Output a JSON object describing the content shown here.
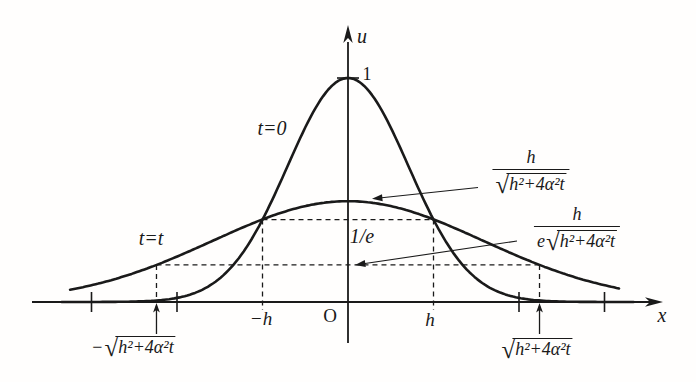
{
  "figure": {
    "ink_color": "#1a1a1a",
    "background_color": "#fffefd",
    "axis": {
      "vertical_label": "u",
      "horizontal_label": "x",
      "origin_label": "O"
    },
    "curve_labels": {
      "t_zero": "t=0",
      "t_t": "t=t"
    },
    "value_labels": {
      "one": "1",
      "one_over_e": "1/e",
      "minus_h": "−h",
      "plus_h": "h"
    },
    "formulas": {
      "radical_sign": "√",
      "flat_peak": {
        "num": "h",
        "pre": "",
        "radicand": "h²+4α²t"
      },
      "flat_over_e": {
        "num": "h",
        "pre": "e",
        "radicand": "h²+4α²t"
      },
      "left_root": {
        "sign": "−",
        "radicand": "h²+4α²t"
      },
      "right_root": {
        "sign": "",
        "radicand": "h²+4α²t"
      }
    }
  },
  "chart_data": {
    "type": "line",
    "title": "",
    "xlabel": "x",
    "ylabel": "u",
    "x_unit": "h",
    "grid": false,
    "series": [
      {
        "name": "t=0",
        "shape": "gaussian",
        "peak": 1.0,
        "sigma": 1.0,
        "drawn_x_range": [
          -3.35,
          3.35
        ]
      },
      {
        "name": "t=t",
        "shape": "gaussian",
        "peak": 0.45,
        "sigma": 2.24,
        "drawn_x_range": [
          -3.25,
          3.19
        ]
      }
    ],
    "x_marks": [
      {
        "x": -2.24,
        "label": "−√(h²+4α²t)"
      },
      {
        "x": -1,
        "label": "−h"
      },
      {
        "x": 0,
        "label": "O"
      },
      {
        "x": 1,
        "label": "h"
      },
      {
        "x": 2.24,
        "label": "√(h²+4α²t)"
      }
    ],
    "unlabeled_axis_ticks_x": [
      -3,
      -2,
      2,
      3
    ],
    "u_marks": [
      {
        "u": 1.0,
        "label": "1"
      },
      {
        "u": 0.368,
        "label": "1/e"
      }
    ],
    "annotations": [
      {
        "text": "h/√(h²+4α²t)",
        "target": "peak of t=t curve"
      },
      {
        "text": "h/(e·√(h²+4α²t))",
        "target": "1/e level of t=t curve (lower dashed line)"
      }
    ],
    "legend_position": "none"
  }
}
